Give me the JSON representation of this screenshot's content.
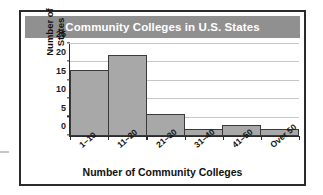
{
  "chart_data": {
    "type": "bar",
    "title": "Community Colleges in U.S. States",
    "xlabel": "Number of Community Colleges",
    "ylabel": "Number of States",
    "ylabel_lines": [
      "Number of",
      "States"
    ],
    "categories": [
      "1–10",
      "11–20",
      "21–30",
      "31–40",
      "41–50",
      "Over 50"
    ],
    "values": [
      18,
      22,
      6,
      2,
      3,
      2
    ],
    "ylim": [
      0,
      25
    ],
    "ytick_values": [
      0,
      5,
      10,
      15,
      20,
      25
    ],
    "ytick_labels": [
      "0",
      "5",
      "10",
      "15",
      "20",
      "25"
    ],
    "grid": true,
    "legend": "none",
    "bar_fill_color": "#a8a8a8",
    "bar_edge_color": "#3a3a3a",
    "title_banner_color": "#909090",
    "title_text_color": "#ffffff",
    "gridline_color": "#c6c6c6",
    "axis_color": "#2b2b2b",
    "frame_border_color": "#2b2b2b"
  }
}
